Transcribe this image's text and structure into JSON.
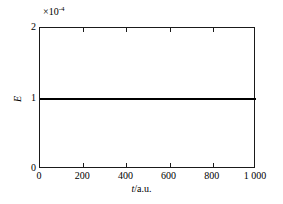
{
  "chart_data": {
    "type": "line",
    "title": "",
    "xlabel": "t/a.u.",
    "xlabel_symbol": "t",
    "xlabel_unit": "/a.u.",
    "ylabel": "E",
    "y_exponent_prefix": "×10",
    "y_exponent_power": "-4",
    "y_scale_factor": 0.0001,
    "xlim": [
      0,
      1000
    ],
    "ylim": [
      0,
      2
    ],
    "grid": false,
    "legend": null,
    "xticks": [
      0,
      200,
      400,
      600,
      800,
      1000
    ],
    "xtick_labels": [
      "0",
      "200",
      "400",
      "600",
      "800",
      "1 000"
    ],
    "yticks": [
      0,
      1,
      2
    ],
    "ytick_labels": [
      "0",
      "1",
      "2"
    ],
    "series": [
      {
        "name": "E(t)",
        "color": "#000000",
        "linewidth": 2,
        "x": [
          0,
          100,
          200,
          300,
          400,
          500,
          600,
          700,
          800,
          900,
          1000
        ],
        "values": [
          1.0,
          1.0,
          1.0,
          1.0,
          1.0,
          1.0,
          1.0,
          1.0,
          1.0,
          1.0,
          1.0
        ],
        "values_absolute": [
          0.0001,
          0.0001,
          0.0001,
          0.0001,
          0.0001,
          0.0001,
          0.0001,
          0.0001,
          0.0001,
          0.0001,
          0.0001
        ]
      }
    ]
  },
  "axes": {
    "frame_color": "#1a1a1a",
    "background": "#ffffff"
  }
}
